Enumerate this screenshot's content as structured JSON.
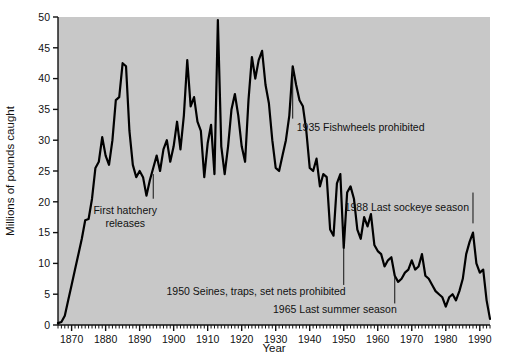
{
  "chart_data": {
    "type": "line",
    "title": "",
    "xlabel": "Year",
    "ylabel": "Millions of pounds caught",
    "xlim": [
      1866,
      1993
    ],
    "ylim": [
      0,
      50
    ],
    "grid": false,
    "legend": "none",
    "y_ticks": [
      0,
      5,
      10,
      15,
      20,
      25,
      30,
      35,
      40,
      45,
      50
    ],
    "y_tick_labels": [
      "0",
      "5",
      "10",
      "15",
      "20",
      "25",
      "30",
      "35",
      "40",
      "45",
      "50"
    ],
    "x_ticks": [
      1870,
      1880,
      1890,
      1900,
      1910,
      1920,
      1930,
      1940,
      1950,
      1960,
      1970,
      1980,
      1990
    ],
    "x_tick_labels": [
      "1870",
      "1880",
      "1890",
      "1900",
      "1910",
      "1920",
      "1930",
      "1940",
      "1950",
      "1960",
      "1970",
      "1980",
      "1990"
    ],
    "x_minor_tick_interval": 1,
    "line_color": "#000000",
    "plot_background": "#c8c8c8",
    "figure_background": "#ffffff",
    "series": [
      {
        "name": "Columbia River salmon catch",
        "x": [
          1866,
          1867,
          1868,
          1869,
          1870,
          1871,
          1872,
          1873,
          1874,
          1875,
          1876,
          1877,
          1878,
          1879,
          1880,
          1881,
          1882,
          1883,
          1884,
          1885,
          1886,
          1887,
          1888,
          1889,
          1890,
          1891,
          1892,
          1893,
          1894,
          1895,
          1896,
          1897,
          1898,
          1899,
          1900,
          1901,
          1902,
          1903,
          1904,
          1905,
          1906,
          1907,
          1908,
          1909,
          1910,
          1911,
          1912,
          1913,
          1914,
          1915,
          1916,
          1917,
          1918,
          1919,
          1920,
          1921,
          1922,
          1923,
          1924,
          1925,
          1926,
          1927,
          1928,
          1929,
          1930,
          1931,
          1932,
          1933,
          1934,
          1935,
          1936,
          1937,
          1938,
          1939,
          1940,
          1941,
          1942,
          1943,
          1944,
          1945,
          1946,
          1947,
          1948,
          1949,
          1950,
          1951,
          1952,
          1953,
          1954,
          1955,
          1956,
          1957,
          1958,
          1959,
          1960,
          1961,
          1962,
          1963,
          1964,
          1965,
          1966,
          1967,
          1968,
          1969,
          1970,
          1971,
          1972,
          1973,
          1974,
          1975,
          1976,
          1977,
          1978,
          1979,
          1980,
          1981,
          1982,
          1983,
          1984,
          1985,
          1986,
          1987,
          1988,
          1989,
          1990,
          1991,
          1992,
          1993
        ],
        "values": [
          0.3,
          0.5,
          1.5,
          4.0,
          6.5,
          9.0,
          11.5,
          14.0,
          17.0,
          17.2,
          20.5,
          25.5,
          26.5,
          30.5,
          27.5,
          26.0,
          30.0,
          36.5,
          37.0,
          42.5,
          42.0,
          31.5,
          26.0,
          24.0,
          25.0,
          24.0,
          21.0,
          23.5,
          25.5,
          27.5,
          25.0,
          28.5,
          30.0,
          26.5,
          29.0,
          33.0,
          28.5,
          34.0,
          43.0,
          35.5,
          37.0,
          33.0,
          31.5,
          24.0,
          29.5,
          32.5,
          24.5,
          49.5,
          29.0,
          24.5,
          29.0,
          35.0,
          37.5,
          34.0,
          29.0,
          26.5,
          36.5,
          43.5,
          40.0,
          43.0,
          44.5,
          39.0,
          36.0,
          30.0,
          25.5,
          25.0,
          27.5,
          30.0,
          34.0,
          42.0,
          39.0,
          36.5,
          35.5,
          31.5,
          25.5,
          25.0,
          27.0,
          22.5,
          24.5,
          24.0,
          15.5,
          14.5,
          23.0,
          24.5,
          12.5,
          21.5,
          22.5,
          20.5,
          15.5,
          14.0,
          17.5,
          16.0,
          18.0,
          13.0,
          12.0,
          11.5,
          9.5,
          10.5,
          11.0,
          8.0,
          7.0,
          7.5,
          8.5,
          9.0,
          10.5,
          9.0,
          9.5,
          11.5,
          8.0,
          7.5,
          6.5,
          5.5,
          5.0,
          4.5,
          3.0,
          4.5,
          5.0,
          4.0,
          5.5,
          7.5,
          11.5,
          13.5,
          15.0,
          10.0,
          8.5,
          9.0,
          4.0,
          1.0
        ]
      }
    ],
    "annotations": [
      {
        "id": "first-hatchery",
        "text_line1": "First hatchery",
        "text_line2": "releases",
        "year": 1894,
        "leader_from_y": 20.5,
        "leader_to_y": 24.5
      },
      {
        "id": "fishwheels",
        "text": "1935 Fishwheels prohibited",
        "year": 1935,
        "leader_from_y": 33.5,
        "leader_to_y": 41.5
      },
      {
        "id": "seines-traps",
        "text": "1950 Seines, traps, set nets prohibited",
        "year": 1950,
        "leader_from_y": 6.5,
        "leader_to_y": 12.5
      },
      {
        "id": "last-summer-season",
        "text": "1965 Last summer season",
        "year": 1965,
        "leader_from_y": 3.5,
        "leader_to_y": 8.0
      },
      {
        "id": "last-sockeye-season",
        "text": "1988 Last sockeye season",
        "year": 1988,
        "leader_from_y": 16.5,
        "leader_to_y": 21.5
      }
    ]
  }
}
